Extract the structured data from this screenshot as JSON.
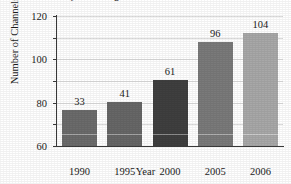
{
  "chart_data": {
    "type": "bar",
    "title_visible_line1": "by the Average Home in the United States",
    "subtitle": "",
    "xlabel": "Year",
    "ylabel": "Number of Channels",
    "categories": [
      "1990",
      "1995",
      "2000",
      "2005",
      "2006"
    ],
    "values": [
      33,
      41,
      61,
      96,
      104
    ],
    "data_labels": [
      "33",
      "41",
      "61",
      "96",
      "104"
    ],
    "ylim": [
      0,
      120
    ],
    "ytick_values": [
      0,
      20,
      40,
      60,
      80,
      100,
      120
    ],
    "ytick_labels": [
      "",
      "20",
      "40",
      "60",
      "80",
      "100",
      "120"
    ],
    "grid": true,
    "legend": "none",
    "bar_colors": [
      "#6b6b6b",
      "#676767",
      "#3f3f3f",
      "#7a7a7a",
      "#a8a8a8"
    ]
  },
  "colors": {
    "axis": "#3a3a3a",
    "grid": "#dcdcdc",
    "text": "#1c1c1c",
    "background": "#ffffff"
  }
}
